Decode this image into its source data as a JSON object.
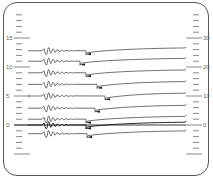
{
  "chart_data": {
    "type": "line",
    "title": "",
    "xlabel": "",
    "ylabel": "",
    "left_axis": {
      "ticks": [
        0,
        5,
        10,
        15
      ],
      "ylim": [
        -5,
        20
      ]
    },
    "right_axis": {
      "ticks": [
        0,
        10,
        20,
        30
      ],
      "ylim": [
        -10,
        40
      ]
    },
    "grid": false,
    "legend": null,
    "series": [
      {
        "name": "trace-1",
        "offset": 12.8,
        "step_x": 86
      },
      {
        "name": "trace-2",
        "offset": 11.0,
        "step_x": 80
      },
      {
        "name": "trace-3",
        "offset": 9.0,
        "step_x": 86
      },
      {
        "name": "trace-4",
        "offset": 7.0,
        "step_x": 97
      },
      {
        "name": "trace-5",
        "offset": 5.0,
        "step_x": 105
      },
      {
        "name": "trace-6",
        "offset": 2.9,
        "step_x": 95
      },
      {
        "name": "trace-7",
        "offset": 1.0,
        "step_x": 86
      },
      {
        "name": "trace-8",
        "offset": 0.0,
        "step_x": 86
      },
      {
        "name": "trace-9",
        "offset": -1.5,
        "step_x": 87
      }
    ]
  },
  "labels": {
    "left": [
      "15",
      "10",
      "5",
      "0"
    ],
    "right": [
      "30",
      "20",
      "10",
      "0"
    ]
  }
}
